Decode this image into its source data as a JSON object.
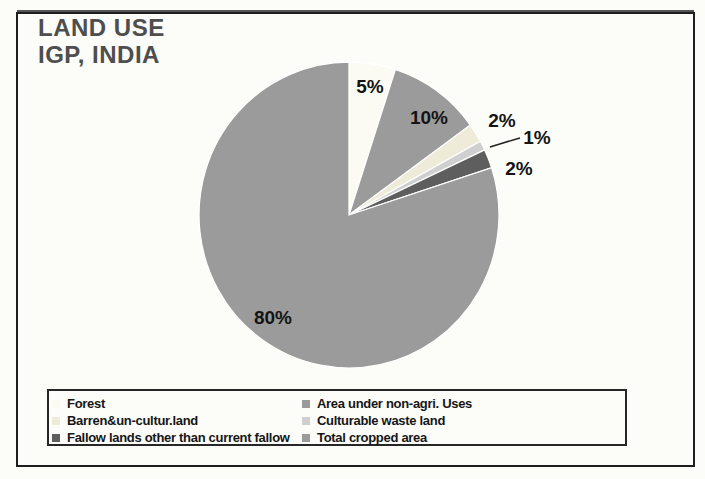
{
  "page": {
    "background": "#fcfcf9"
  },
  "title": {
    "line1": "LAND USE",
    "line2": "IGP, INDIA",
    "color": "#4e4e4e"
  },
  "chart_data": {
    "type": "pie",
    "title": "LAND USE IGP, INDIA",
    "start_angle_deg": 0,
    "direction": "clockwise",
    "geometry": {
      "cx": 349,
      "cy": 215,
      "rx": 150,
      "ry": 153
    },
    "label_color": "#141414",
    "stroke_color": "#ffffff",
    "slices": [
      {
        "label": "Forest",
        "value": 5,
        "data_label": "5%",
        "color": "#fbfbf3",
        "label_x": 370,
        "label_y": 86
      },
      {
        "label": "Area under non-agri. Uses",
        "value": 10,
        "data_label": "10%",
        "color": "#9b9b9b",
        "label_x": 429,
        "label_y": 117
      },
      {
        "label": "Barren&un-cultur.land",
        "value": 2,
        "data_label": "2%",
        "color": "#eeebd9",
        "label_x": 502,
        "label_y": 120
      },
      {
        "label": "Culturable waste land",
        "value": 1,
        "data_label": "1%",
        "color": "#cfcfcf",
        "label_x": 537,
        "label_y": 137
      },
      {
        "label": "Fallow lands other than current fallow",
        "value": 2,
        "data_label": "2%",
        "color": "#5e5e5e",
        "label_x": 519,
        "label_y": 168
      },
      {
        "label": "Total cropped area",
        "value": 80,
        "data_label": "80%",
        "color": "#9b9b9b",
        "label_x": 273,
        "label_y": 317
      }
    ],
    "callout": {
      "for": "Culturable waste land",
      "points": [
        [
          490,
          147
        ],
        [
          503,
          143
        ],
        [
          520,
          138
        ]
      ],
      "color": "#222222"
    },
    "legend": {
      "position": "bottom",
      "columns": 2,
      "grid": "row-major"
    }
  }
}
